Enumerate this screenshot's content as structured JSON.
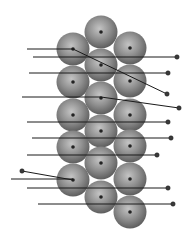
{
  "diagram": {
    "title": "",
    "canvas": {
      "width": 189,
      "height": 240,
      "background": "#ffffff"
    },
    "colors": {
      "sphere_light": "#c4c4c4",
      "sphere_mid": "#8f8f8f",
      "sphere_dark": "#5e5e5e",
      "nucleus": "#222222",
      "line": "#1a1a1a",
      "end_dot": "#3a3a3a"
    },
    "sphere_radius": 16.5,
    "spheres": [
      {
        "id": "s1",
        "cx": 101,
        "cy": 32
      },
      {
        "id": "s2",
        "cx": 73,
        "cy": 49
      },
      {
        "id": "s3",
        "cx": 130,
        "cy": 48
      },
      {
        "id": "s4",
        "cx": 101,
        "cy": 65
      },
      {
        "id": "s5",
        "cx": 73,
        "cy": 82
      },
      {
        "id": "s6",
        "cx": 130,
        "cy": 81
      },
      {
        "id": "s7",
        "cx": 101,
        "cy": 98
      },
      {
        "id": "s8",
        "cx": 73,
        "cy": 115
      },
      {
        "id": "s9",
        "cx": 130,
        "cy": 115
      },
      {
        "id": "s10",
        "cx": 101,
        "cy": 131
      },
      {
        "id": "s11",
        "cx": 73,
        "cy": 147
      },
      {
        "id": "s12",
        "cx": 130,
        "cy": 146
      },
      {
        "id": "s13",
        "cx": 101,
        "cy": 163
      },
      {
        "id": "s14",
        "cx": 73,
        "cy": 180
      },
      {
        "id": "s15",
        "cx": 130,
        "cy": 179
      },
      {
        "id": "s16",
        "cx": 101,
        "cy": 197
      },
      {
        "id": "s17",
        "cx": 130,
        "cy": 212
      }
    ],
    "leader_lines": [
      {
        "id": "l1",
        "points": [
          [
            27,
            49
          ],
          [
            73,
            49
          ]
        ],
        "dot": null
      },
      {
        "id": "l2",
        "points": [
          [
            73,
            49
          ],
          [
            167,
            94
          ]
        ],
        "dot": [
          167,
          94
        ]
      },
      {
        "id": "l3",
        "points": [
          [
            33,
            57
          ],
          [
            177,
            57
          ]
        ],
        "dot": [
          177,
          57
        ]
      },
      {
        "id": "l4",
        "points": [
          [
            29,
            73
          ],
          [
            168,
            73
          ]
        ],
        "dot": [
          168,
          73
        ]
      },
      {
        "id": "l5",
        "points": [
          [
            22,
            97
          ],
          [
            101,
            97
          ],
          [
            179,
            108
          ]
        ],
        "dot": [
          179,
          108
        ]
      },
      {
        "id": "l6",
        "points": [
          [
            27,
            122
          ],
          [
            168,
            122
          ]
        ],
        "dot": [
          168,
          122
        ]
      },
      {
        "id": "l7",
        "points": [
          [
            32,
            138
          ],
          [
            171,
            138
          ]
        ],
        "dot": [
          171,
          138
        ]
      },
      {
        "id": "l8",
        "points": [
          [
            27,
            155
          ],
          [
            157,
            155
          ]
        ],
        "dot": [
          157,
          155
        ]
      },
      {
        "id": "l9",
        "points": [
          [
            22,
            171
          ],
          [
            73,
            180
          ]
        ],
        "dot": [
          22,
          171
        ]
      },
      {
        "id": "l10",
        "points": [
          [
            11,
            179
          ],
          [
            73,
            179
          ]
        ],
        "dot": null
      },
      {
        "id": "l11",
        "points": [
          [
            27,
            188
          ],
          [
            168,
            188
          ]
        ],
        "dot": [
          168,
          188
        ]
      },
      {
        "id": "l12",
        "points": [
          [
            38,
            204
          ],
          [
            173,
            204
          ]
        ],
        "dot": [
          173,
          204
        ]
      }
    ],
    "labels": []
  }
}
